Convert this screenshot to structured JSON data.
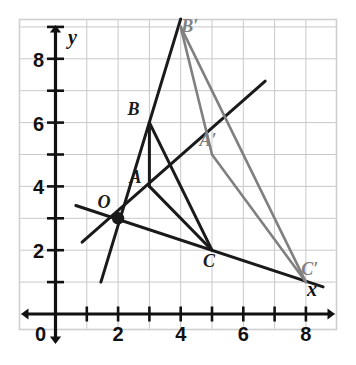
{
  "figure": {
    "type": "coordinate-geometry-diagram"
  },
  "axes": {
    "x_axis_label": "x",
    "y_axis_label": "y",
    "origin_label": "0",
    "x_ticks": [
      {
        "value": 2,
        "label": "2"
      },
      {
        "value": 4,
        "label": "4"
      },
      {
        "value": 6,
        "label": "6"
      },
      {
        "value": 8,
        "label": "8"
      }
    ],
    "y_ticks": [
      {
        "value": 2,
        "label": "2"
      },
      {
        "value": 4,
        "label": "4"
      },
      {
        "value": 6,
        "label": "6"
      },
      {
        "value": 8,
        "label": "8"
      }
    ],
    "x_range": [
      0,
      9
    ],
    "y_range": [
      0,
      9
    ],
    "grid": true,
    "grid_step": 1
  },
  "colors": {
    "axis": "#111111",
    "grid": "#c8c8c8",
    "preimage": "#1a1a1a",
    "image": "#808080",
    "ray": "#1a1a1a",
    "border": "#cfcfcf",
    "background": "#ffffff"
  },
  "points": {
    "O": {
      "label": "O",
      "x": 2,
      "y": 3,
      "label_dx": -14,
      "label_dy": -10,
      "marker": "dot"
    },
    "A": {
      "label": "A",
      "x": 3,
      "y": 4,
      "label_dx": -14,
      "label_dy": -3,
      "marker": "none"
    },
    "B": {
      "label": "B",
      "x": 3,
      "y": 6,
      "label_dx": -16,
      "label_dy": -8,
      "marker": "none"
    },
    "C": {
      "label": "C",
      "x": 5,
      "y": 2,
      "label_dx": -3,
      "label_dy": 17,
      "marker": "none"
    },
    "Ap": {
      "label": "A′",
      "x": 5,
      "y": 5,
      "label_dx": -4,
      "label_dy": -9,
      "marker": "none"
    },
    "Bp": {
      "label": "B′",
      "x": 4,
      "y": 9,
      "label_dx": 9,
      "label_dy": 5,
      "marker": "none"
    },
    "Cp": {
      "label": "C′",
      "x": 8,
      "y": 1,
      "label_dx": 4,
      "label_dy": -7,
      "marker": "none"
    }
  },
  "preimage_triangle": {
    "name": "ABC",
    "vertices": [
      "A",
      "B",
      "C"
    ],
    "edges": [
      [
        "A",
        "B"
      ],
      [
        "B",
        "C"
      ],
      [
        "C",
        "A"
      ]
    ]
  },
  "image_triangle": {
    "name": "A′B′C′",
    "vertices": [
      "Ap",
      "Bp",
      "Cp"
    ],
    "edges": [
      [
        "Ap",
        "Bp"
      ],
      [
        "Bp",
        "Cp"
      ],
      [
        "Cp",
        "Ap"
      ]
    ]
  },
  "dilation_rays": [
    {
      "name": "ray-O-A-Aprime",
      "from": [
        0.85,
        2.25
      ],
      "to": [
        6.7,
        7.3
      ]
    },
    {
      "name": "ray-O-B-Bprime",
      "from": [
        1.45,
        1.0
      ],
      "to": [
        4.0,
        9.25
      ]
    },
    {
      "name": "ray-O-C-Cprime",
      "from": [
        0.65,
        3.4
      ],
      "to": [
        8.55,
        0.85
      ]
    }
  ],
  "notes": {
    "center_of_dilation": "O",
    "scale_factor": "1.5"
  }
}
